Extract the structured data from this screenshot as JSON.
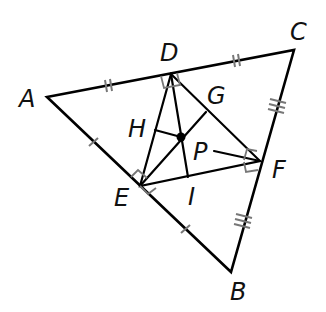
{
  "diagram": {
    "type": "geometry",
    "points": {
      "A": {
        "label": "A",
        "x": 47,
        "y": 97
      },
      "B": {
        "label": "B",
        "x": 231,
        "y": 272
      },
      "C": {
        "label": "C",
        "x": 294,
        "y": 50
      },
      "D": {
        "label": "D",
        "x": 171,
        "y": 74
      },
      "E": {
        "label": "E",
        "x": 140,
        "y": 186
      },
      "F": {
        "label": "F",
        "x": 260,
        "y": 161
      },
      "P": {
        "label": "P",
        "x": 181,
        "y": 137
      },
      "G": {
        "label": "G",
        "x": 206,
        "y": 112
      },
      "H": {
        "label": "H",
        "x": 155,
        "y": 130
      },
      "I": {
        "label": "I",
        "x": 188,
        "y": 177
      }
    },
    "labels": {
      "A": "A",
      "B": "B",
      "C": "C",
      "D": "D",
      "E": "E",
      "F": "F",
      "G": "G",
      "H": "H",
      "I": "I",
      "P": "P"
    },
    "tick_marks": {
      "AD": 2,
      "DC": 2,
      "AE": 1,
      "EB": 1,
      "CF": 3,
      "FB": 3
    },
    "right_angles": [
      "D",
      "E",
      "F"
    ],
    "colors": {
      "lines": "#000000",
      "marks": "#777777"
    }
  }
}
